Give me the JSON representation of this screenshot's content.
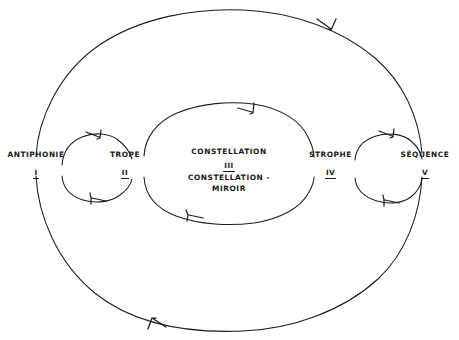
{
  "diagram": {
    "type": "cyclic-flow-diagram",
    "style": "hand-drawn sketch, black ink on white paper",
    "language": "French",
    "background_color": "#ffffff",
    "ink_color": "#1d1d1d",
    "nodes": [
      {
        "id": "antiphonie",
        "title": "ANTIPHONIE",
        "numeral": "I",
        "x": 35,
        "y": 163
      },
      {
        "id": "trope",
        "title": "TROPE",
        "numeral": "II",
        "x": 125,
        "y": 163
      },
      {
        "id": "constellation",
        "title_line_1": "CONSTELLATION",
        "numeral": "III",
        "title_line_2": "CONSTELLATION -",
        "title_line_3": "MIROIR",
        "x": 228,
        "y": 158
      },
      {
        "id": "strophe",
        "title": "STROPHE",
        "numeral": "IV",
        "x": 330,
        "y": 163
      },
      {
        "id": "sequence",
        "title": "SÉQUENCE",
        "numeral": "V",
        "x": 424,
        "y": 163
      }
    ],
    "loops": [
      {
        "id": "outer-loop",
        "from": "antiphonie",
        "to": "sequence",
        "direction": "clockwise",
        "arrow_positions": [
          "top-right",
          "bottom-left"
        ]
      },
      {
        "id": "middle-loop",
        "from": "trope",
        "to": "strophe",
        "direction": "clockwise",
        "arrow_positions": [
          "top-right",
          "bottom-left"
        ]
      },
      {
        "id": "left-loop",
        "from": "antiphonie",
        "to": "trope",
        "direction": "clockwise",
        "arrow_positions": [
          "top-right",
          "bottom-left"
        ]
      },
      {
        "id": "right-loop",
        "from": "strophe",
        "to": "sequence",
        "direction": "clockwise",
        "arrow_positions": [
          "top-right",
          "bottom-left"
        ]
      }
    ]
  }
}
